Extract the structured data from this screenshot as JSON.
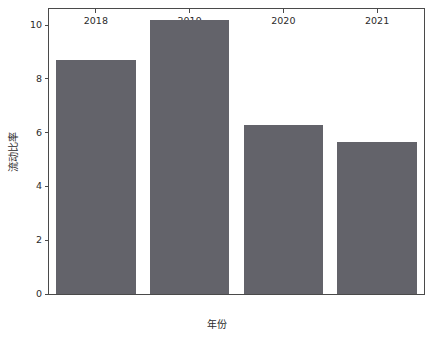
{
  "chart_data": {
    "type": "bar",
    "title": "",
    "subtitle": "",
    "xlabel": "年份",
    "ylabel": "流动比率",
    "categories": [
      "2018",
      "2019",
      "2020",
      "2021"
    ],
    "values": [
      8.7,
      10.2,
      6.3,
      5.65
    ],
    "series": [
      {
        "name": "流动比率",
        "values": [
          8.7,
          10.2,
          6.3,
          5.65
        ]
      }
    ],
    "xtick_labels": [
      "2018",
      "2019",
      "2020",
      "2021"
    ],
    "ytick_labels": [
      "0",
      "2",
      "4",
      "6",
      "8",
      "10"
    ],
    "ytick_values": [
      0,
      2,
      4,
      6,
      8,
      10
    ],
    "ylim": [
      0,
      10.6
    ],
    "grid": false,
    "legend": false,
    "legend_position": "none",
    "bar_color": "#63636a",
    "axis_color": "#4a4a4a",
    "text_color": "#2b2b2b",
    "background_color": "#ffffff"
  }
}
